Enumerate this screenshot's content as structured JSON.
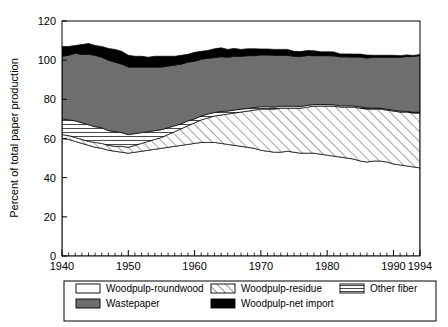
{
  "chart_data": {
    "type": "area",
    "title": "",
    "subtitle": "",
    "xlabel": "",
    "ylabel": "Percent of total paper production",
    "xlim": [
      1940,
      1994
    ],
    "ylim": [
      0,
      120
    ],
    "ytick_values": [
      0,
      20,
      40,
      60,
      80,
      100,
      120
    ],
    "ytick_labels": [
      "0",
      "20",
      "40",
      "60",
      "80",
      "100",
      "120"
    ],
    "xtick_values": [
      1940,
      1950,
      1960,
      1970,
      1980,
      1990,
      1994
    ],
    "xtick_labels": [
      "1940",
      "1950",
      "1960",
      "1970",
      "1980",
      "1990",
      "1994"
    ],
    "minor_xtick_interval": 1,
    "grid": false,
    "stacked": true,
    "legend_position": "below",
    "x": [
      1940,
      1941,
      1942,
      1943,
      1944,
      1945,
      1946,
      1947,
      1948,
      1949,
      1950,
      1951,
      1952,
      1953,
      1954,
      1955,
      1956,
      1957,
      1958,
      1959,
      1960,
      1961,
      1962,
      1963,
      1964,
      1965,
      1966,
      1967,
      1968,
      1969,
      1970,
      1971,
      1972,
      1973,
      1974,
      1975,
      1976,
      1977,
      1978,
      1979,
      1980,
      1981,
      1982,
      1983,
      1984,
      1985,
      1986,
      1987,
      1988,
      1989,
      1990,
      1991,
      1992,
      1993,
      1994
    ],
    "series": [
      {
        "name": "Woodpulp-roundwood",
        "fill": "solid-white",
        "color": "#ffffff",
        "values": [
          60.0,
          59.5,
          58.5,
          57.5,
          56.5,
          55.5,
          55.0,
          54.0,
          53.5,
          53.0,
          52.5,
          53.0,
          53.5,
          54.0,
          54.5,
          55.0,
          55.5,
          56.0,
          56.5,
          57.0,
          57.5,
          58.0,
          58.0,
          58.0,
          57.5,
          57.0,
          56.5,
          56.0,
          55.5,
          55.0,
          54.0,
          53.5,
          53.0,
          53.0,
          53.5,
          53.0,
          52.5,
          52.5,
          52.5,
          52.0,
          51.5,
          51.0,
          50.5,
          50.0,
          49.5,
          48.5,
          48.0,
          48.5,
          48.5,
          48.0,
          47.0,
          46.5,
          46.0,
          45.5,
          45.0
        ]
      },
      {
        "name": "Woodpulp-residue",
        "fill": "diagonal-hatch",
        "color": "#ffffff",
        "values": [
          2.0,
          2.0,
          2.0,
          2.0,
          2.0,
          2.5,
          2.5,
          2.5,
          2.5,
          3.0,
          3.0,
          3.5,
          4.0,
          4.5,
          5.0,
          5.5,
          6.5,
          7.5,
          8.5,
          9.5,
          10.5,
          11.5,
          12.5,
          13.5,
          14.5,
          15.5,
          16.5,
          17.5,
          18.5,
          19.5,
          21.0,
          21.5,
          22.0,
          22.5,
          22.0,
          22.5,
          23.0,
          23.5,
          24.0,
          24.5,
          25.0,
          25.5,
          25.5,
          26.0,
          26.5,
          27.0,
          27.0,
          26.5,
          26.5,
          26.5,
          27.0,
          27.0,
          27.5,
          27.5,
          28.0
        ]
      },
      {
        "name": "Other fiber",
        "fill": "horizontal-hatch",
        "color": "#ffffff",
        "values": [
          8.0,
          8.0,
          8.5,
          8.5,
          8.5,
          8.0,
          8.0,
          7.5,
          7.5,
          7.0,
          6.5,
          6.0,
          5.5,
          5.0,
          4.5,
          4.0,
          3.5,
          3.0,
          2.5,
          2.5,
          2.0,
          2.0,
          2.0,
          1.8,
          1.8,
          1.5,
          1.5,
          1.5,
          1.3,
          1.3,
          1.2,
          1.2,
          1.0,
          1.0,
          1.0,
          1.0,
          0.9,
          0.9,
          0.8,
          0.8,
          0.8,
          0.7,
          0.7,
          0.7,
          0.6,
          0.6,
          0.6,
          0.5,
          0.5,
          0.5,
          0.5,
          0.5,
          0.4,
          0.4,
          0.4
        ]
      },
      {
        "name": "Wastepaper",
        "fill": "solid",
        "color": "#6e6e6e",
        "values": [
          32.0,
          33.0,
          34.5,
          35.0,
          36.0,
          36.5,
          36.0,
          36.0,
          35.5,
          35.0,
          34.5,
          34.0,
          33.5,
          33.0,
          32.5,
          32.0,
          31.5,
          31.0,
          30.5,
          30.0,
          29.5,
          29.0,
          28.5,
          28.0,
          28.0,
          27.5,
          27.5,
          27.0,
          27.0,
          26.5,
          26.5,
          26.5,
          26.5,
          26.0,
          26.0,
          25.5,
          25.5,
          25.5,
          25.0,
          25.0,
          25.0,
          25.0,
          25.0,
          25.0,
          25.0,
          25.5,
          25.5,
          26.0,
          26.0,
          26.5,
          27.0,
          27.5,
          28.0,
          28.5,
          29.0
        ]
      },
      {
        "name": "Woodpulp-net import",
        "fill": "solid",
        "color": "#000000",
        "values": [
          5.0,
          4.5,
          4.0,
          5.0,
          5.5,
          5.0,
          5.5,
          6.0,
          6.5,
          6.5,
          6.0,
          5.5,
          5.5,
          5.0,
          5.5,
          5.5,
          5.0,
          4.5,
          4.5,
          4.0,
          4.5,
          4.0,
          4.0,
          4.5,
          4.5,
          4.0,
          4.0,
          3.5,
          3.5,
          3.5,
          3.0,
          3.0,
          3.0,
          3.0,
          3.0,
          2.5,
          2.5,
          2.5,
          2.5,
          2.0,
          2.0,
          2.0,
          1.5,
          1.5,
          1.5,
          1.5,
          1.5,
          1.0,
          1.0,
          1.0,
          1.0,
          0.8,
          0.8,
          0.5,
          0.5
        ]
      }
    ],
    "legend": [
      {
        "label": "Woodpulp-roundwood",
        "fill": "solid-white"
      },
      {
        "label": "Woodpulp-residue",
        "fill": "diagonal-hatch"
      },
      {
        "label": "Other fiber",
        "fill": "horizontal-hatch"
      },
      {
        "label": "Wastepaper",
        "fill": "solid-gray"
      },
      {
        "label": "Woodpulp-net import",
        "fill": "solid-black"
      }
    ]
  },
  "colors": {
    "wastepaper": "#6e6e6e",
    "net_import": "#000000",
    "axis": "#000000",
    "background": "#ffffff"
  }
}
